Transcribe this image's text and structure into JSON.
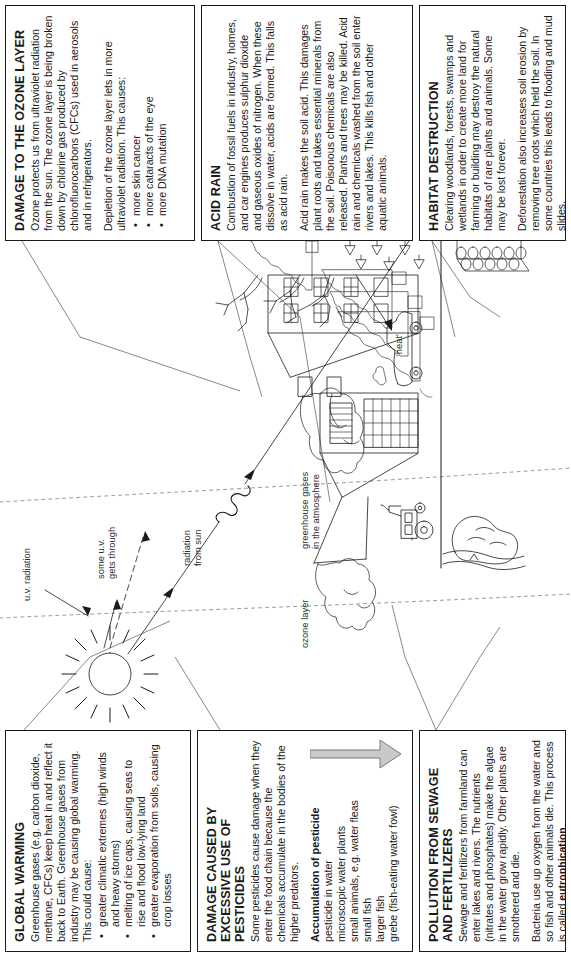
{
  "document": {
    "title": "Environmental damage diagram",
    "orientation": "rotated-90-ccw"
  },
  "panels": {
    "ozone": {
      "title": "DAMAGE TO THE OZONE LAYER",
      "para1": "Ozone protects us from ultraviolet radiation from the sun. The ozone layer is being broken down by chlorine gas produced by chlorofluorocarbons (CFCs) used in aerosols and in refrigerators.",
      "para2": "Depletion of the ozone layer lets in more ultraviolet radiation. This causes:",
      "bullets": [
        "more skin cancer",
        "more cataracts of the eye",
        "more DNA mutation"
      ]
    },
    "acid_rain": {
      "title": "ACID RAIN",
      "para1": "Combustion of fossil fuels in industry, homes, and car engines produces sulphur dioxide and gaseous oxides of nitrogen. When these dissolve in water, acids are formed. This falls as acid rain.",
      "para2": "Acid rain makes the soil acid. This damages plant roots and takes essential minerals from the soil. Poisonous chemicals are also released. Plants and trees may be killed. Acid rain and chemicals washed from the soil enter rivers and lakes. This kills fish and other aquatic animals."
    },
    "habitat": {
      "title": "HABITAT DESTRUCTION",
      "para1": "Clearing woodlands, forests, swamps and wetlands in order to create more land for farming or building may destroy the natural habitats of rare plants and animals. Some may be lost forever.",
      "para2": "Deforestation also increases soil erosion by removing tree roots which held the soil. In some countries this leads to flooding and mud slides."
    },
    "global_warming": {
      "title": "GLOBAL WARMING",
      "para1": "Greenhouse gases (e.g. carbon dioxide, methane, CFCs) keep heat in and reflect it back to Earth. Greenhouse gases from industry may be causing global warming. This could cause:",
      "bullets": [
        "greater climatic extremes (high winds and heavy storms)",
        "melting of ice caps, causing seas to rise and flood low-lying land",
        "greater evaporation from soils, causing crop losses"
      ]
    },
    "pesticides": {
      "title_line1": "DAMAGE CAUSED BY",
      "title_line2": "EXCESSIVE USE OF PESTICIDES",
      "para1": "Some pesticides cause damage when they enter the food chain because the chemicals accumulate in the bodies of the higher predators.",
      "subhead": "Accumulation of pesticide",
      "chain": [
        "pesticide in water",
        "microscopic water plants",
        "small animals, e.g. water fleas",
        "small fish",
        "larger fish",
        "grebe (fish-eating water fowl)"
      ]
    },
    "sewage": {
      "title_line1": "POLLUTION FROM SEWAGE",
      "title_line2": "AND FERTILIZERS",
      "para1": "Sewage and fertilizers from farmland can enter lakes and rivers. The nutrients (nitrates and phosphates) make the algae in the water grow rapidly. Other plants are smothered and die.",
      "para2_a": "Bacteria use up oxygen from the water and so fish and other animals die. This process is called ",
      "para2_bold": "eutrophication",
      "para2_b": "."
    }
  },
  "diagram": {
    "labels": {
      "uv_radiation": "u.v. radiation",
      "some_uv": "some u.v.",
      "gets_through": "gets through",
      "radiation_from": "radiation",
      "radiation_sun": "from sun",
      "ozone_layer": "ozone layer",
      "greenhouse_gases": "greenhouse gases",
      "in_atmosphere": "in the atmosphere",
      "heat": "'heat'"
    },
    "elements": [
      "sun",
      "ozone-layer-dashed-arc",
      "greenhouse-layer-dashed-arc",
      "factory-with-smoke",
      "house-with-chimney-smoke",
      "car",
      "tractor",
      "dead-trees",
      "conifer-trees",
      "saplings",
      "log-pile",
      "lake",
      "ground-line"
    ],
    "colors": {
      "ink": "#1a1a1a",
      "dashed": "#888888",
      "arrow_fill": "#c9c9c9"
    }
  }
}
